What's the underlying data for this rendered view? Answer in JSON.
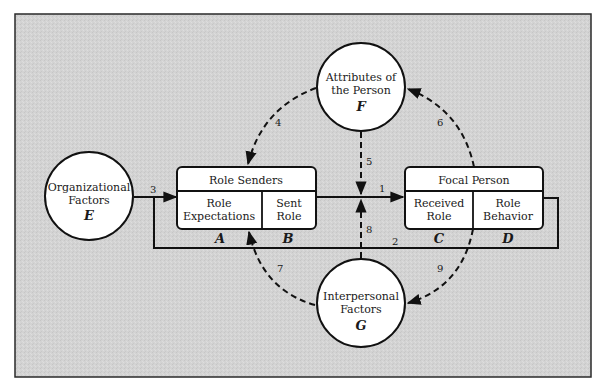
{
  "diagram": {
    "colors": {
      "background": "#d2d2d2",
      "frame": "#2a2a2a",
      "shape_fill": "#ffffff",
      "stroke": "#111111"
    },
    "circles": {
      "organizational_factors": {
        "line1": "Organizational",
        "line2": "Factors",
        "letter": "E"
      },
      "attributes_of_person": {
        "line1": "Attributes of",
        "line2": "the Person",
        "letter": "F"
      },
      "interpersonal_factors": {
        "line1": "Interpersonal",
        "line2": "Factors",
        "letter": "G"
      }
    },
    "boxes": {
      "role_senders": {
        "title": "Role Senders",
        "left_line1": "Role",
        "left_line2": "Expectations",
        "right_line1": "Sent",
        "right_line2": "Role",
        "left_letter": "A",
        "right_letter": "B"
      },
      "focal_person": {
        "title": "Focal Person",
        "left_line1": "Received",
        "left_line2": "Role",
        "right_line1": "Role",
        "right_line2": "Behavior",
        "left_letter": "C",
        "right_letter": "D"
      }
    },
    "arrows": [
      {
        "id": "1",
        "label": "1",
        "style": "solid",
        "from": "Sent Role (B)",
        "to": "Received Role (C)"
      },
      {
        "id": "2",
        "label": "2",
        "style": "solid",
        "from": "Role Behavior (D)",
        "to": "Role Expectations (A)"
      },
      {
        "id": "3",
        "label": "3",
        "style": "solid",
        "from": "Organizational Factors (E)",
        "to": "Role Senders (A)"
      },
      {
        "id": "4",
        "label": "4",
        "style": "dashed",
        "from": "Attributes of the Person (F)",
        "to": "Role Senders (A)"
      },
      {
        "id": "5",
        "label": "5",
        "style": "dashed",
        "from": "Attributes of the Person (F)",
        "to": "Arrow 1"
      },
      {
        "id": "6",
        "label": "6",
        "style": "dashed",
        "from": "Role Behavior (D)",
        "to": "Attributes of the Person (F)"
      },
      {
        "id": "7",
        "label": "7",
        "style": "dashed",
        "from": "Interpersonal Factors (G)",
        "to": "Role Expectations (A)"
      },
      {
        "id": "8",
        "label": "8",
        "style": "dashed",
        "from": "Interpersonal Factors (G)",
        "to": "Arrow 1"
      },
      {
        "id": "9",
        "label": "9",
        "style": "dashed",
        "from": "Received Role (C)",
        "to": "Interpersonal Factors (G)"
      }
    ]
  }
}
